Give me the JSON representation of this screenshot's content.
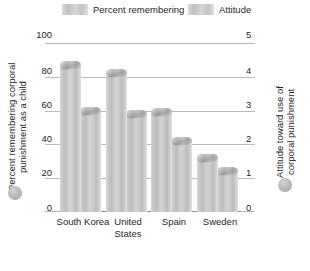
{
  "legend": {
    "entries": [
      {
        "label": "Percent remembering",
        "swatch": "legend-swatch-percent",
        "color": "#c8c8c8"
      },
      {
        "label": "Attitude",
        "swatch": "legend-swatch-attitude",
        "color": "#c8c8c8"
      }
    ]
  },
  "axes": {
    "left": {
      "title": "Percent remembering corporal punishment as a child",
      "ticks": [
        "100",
        "80",
        "60",
        "40",
        "20",
        "0"
      ],
      "marker": "gray-dot-marker"
    },
    "right": {
      "title": "Attitude toward use of corporal punishment",
      "ticks": [
        "5",
        "4",
        "3",
        "2",
        "1",
        "0"
      ],
      "marker": "gray-dot-marker"
    }
  },
  "chart_data": {
    "type": "bar",
    "title": "",
    "xlabel": "",
    "ylabel": "Percent remembering corporal punishment as a child",
    "y2label": "Attitude toward use of corporal punishment",
    "categories": [
      "South Korea",
      "United States",
      "Spain",
      "Sweden"
    ],
    "series": [
      {
        "name": "Percent remembering",
        "axis": "left",
        "values": [
          87,
          82,
          59,
          32
        ]
      },
      {
        "name": "Attitude",
        "axis": "right",
        "values": [
          3.0,
          2.9,
          2.1,
          1.2
        ]
      }
    ],
    "ylim": [
      0,
      100
    ],
    "y2lim": [
      0,
      5
    ],
    "yticks": [
      0,
      20,
      40,
      60,
      80,
      100
    ],
    "y2ticks": [
      0,
      1,
      2,
      3,
      4,
      5
    ],
    "grid": true,
    "legend_position": "top"
  }
}
